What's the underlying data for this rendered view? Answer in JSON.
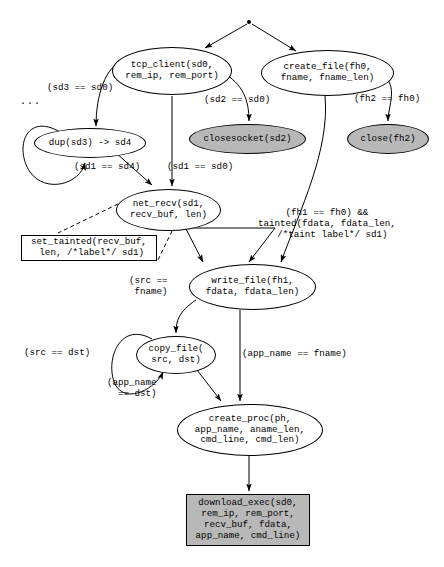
{
  "diagram": {
    "root_marker": "root-node-dot",
    "ellipsis_marker": "...",
    "colors": {
      "shaded_fill": "#b8b8b8",
      "plain_fill": "#ffffff",
      "stroke": "#000000"
    },
    "nodes": [
      {
        "id": "tcp_client",
        "shape": "ellipse",
        "shaded": false,
        "text": "tcp_client(sd0,\nrem_ip, rem_port)",
        "x": 112,
        "y": 47,
        "w": 120,
        "h": 48,
        "fs": 9.2
      },
      {
        "id": "create_file",
        "shape": "ellipse",
        "shaded": false,
        "text": "create_file(fh0,\nfname, fname_len)",
        "x": 261,
        "y": 50,
        "w": 133,
        "h": 46,
        "fs": 9.2
      },
      {
        "id": "dup",
        "shape": "ellipse",
        "shaded": false,
        "text": "dup(sd3) -> sd4",
        "x": 34,
        "y": 128,
        "w": 112,
        "h": 30,
        "fs": 9.2
      },
      {
        "id": "closesocket",
        "shape": "ellipse",
        "shaded": true,
        "text": "closesocket(sd2)",
        "x": 189,
        "y": 124,
        "w": 117,
        "h": 30,
        "fs": 9.2
      },
      {
        "id": "close",
        "shape": "ellipse",
        "shaded": true,
        "text": "close(fh2)",
        "x": 347,
        "y": 124,
        "w": 82,
        "h": 30,
        "fs": 9.2
      },
      {
        "id": "net_recv",
        "shape": "ellipse",
        "shaded": false,
        "text": "net_recv(sd1,\nrecv_buf, len)",
        "x": 116,
        "y": 189,
        "w": 105,
        "h": 42,
        "fs": 9.2
      },
      {
        "id": "set_tainted",
        "shape": "rect",
        "shaded": false,
        "text": "set_tainted(recv_buf,\n len, /*label*/ sd1)",
        "x": 21,
        "y": 235,
        "w": 136,
        "h": 26,
        "fs": 9.2
      },
      {
        "id": "write_file",
        "shape": "ellipse",
        "shaded": false,
        "text": "write_file(fh1,\nfdata, fdata_len)",
        "x": 189,
        "y": 264,
        "w": 127,
        "h": 46,
        "fs": 9.2
      },
      {
        "id": "copy_file",
        "shape": "ellipse",
        "shaded": false,
        "text": "copy_file(\nsrc, dst)",
        "x": 136,
        "y": 336,
        "w": 80,
        "h": 38,
        "fs": 9.2
      },
      {
        "id": "create_proc",
        "shape": "ellipse",
        "shaded": false,
        "text": "create_proc(ph,\napp_name, aname_len,\ncmd_line, cmd_len)",
        "x": 177,
        "y": 404,
        "w": 146,
        "h": 52,
        "fs": 9.2
      },
      {
        "id": "download_exec",
        "shape": "rect",
        "shaded": true,
        "text": "download_exec(sd0,\nrem_ip, rem_port,\nrecv_buf, fdata,\napp_name, cmd_line)",
        "x": 186,
        "y": 494,
        "w": 124,
        "h": 52,
        "fs": 9.2
      }
    ],
    "edge_labels": [
      {
        "id": "sd3-eq-sd0",
        "text": "(sd3 == sd0)",
        "x": 47,
        "y": 83,
        "fs": 9.2,
        "align": "left"
      },
      {
        "id": "sd2-eq-sd0",
        "text": "(sd2 == sd0)",
        "x": 204,
        "y": 95,
        "fs": 9.2,
        "align": "left"
      },
      {
        "id": "fh2-eq-fh0",
        "text": "(fh2 == fh0)",
        "x": 354,
        "y": 94,
        "fs": 9.2,
        "align": "left"
      },
      {
        "id": "sd1-eq-sd4",
        "text": "(sd1 == sd4)",
        "x": 74,
        "y": 162,
        "fs": 9.2,
        "align": "left"
      },
      {
        "id": "sd1-eq-sd0",
        "text": "(sd1 == sd0)",
        "x": 167,
        "y": 162,
        "fs": 9.2,
        "align": "left"
      },
      {
        "id": "taint-cond",
        "text": "(fh1 == fh0) &&\ntainted(fdata, fdata_len,\n  /*taint label*/ sd1)",
        "x": 258,
        "y": 208,
        "fs": 9.2,
        "align": "center"
      },
      {
        "id": "src-eq-fname",
        "text": "(src ==\n fname)",
        "x": 129,
        "y": 276,
        "fs": 9.2,
        "align": "center"
      },
      {
        "id": "src-eq-dst",
        "text": "(src == dst)",
        "x": 24,
        "y": 348,
        "fs": 9.2,
        "align": "left"
      },
      {
        "id": "app-eq-fname",
        "text": "(app_name == fname)",
        "x": 242,
        "y": 349,
        "fs": 9.2,
        "align": "left"
      },
      {
        "id": "app-eq-dst",
        "text": "(app_name\n  == dst)",
        "x": 107,
        "y": 378,
        "fs": 9.2,
        "align": "center"
      }
    ]
  }
}
